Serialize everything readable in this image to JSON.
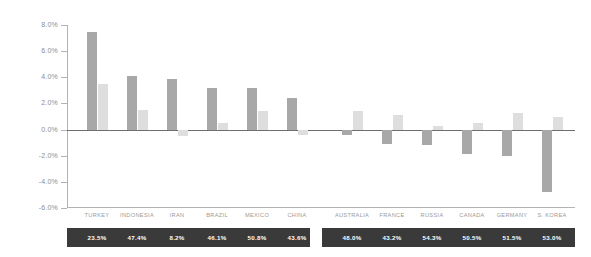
{
  "chart_data": {
    "type": "bar",
    "title": "",
    "subtitle": "",
    "xlabel": "",
    "ylabel": "",
    "ylim": [
      -6.0,
      8.0
    ],
    "yticks": [
      "8.0%",
      "6.0%",
      "4.0%",
      "2.0%",
      "0.0%",
      "-2.0%",
      "-4.0%",
      "-6.0%"
    ],
    "ytick_values": [
      8.0,
      6.0,
      4.0,
      2.0,
      0.0,
      -2.0,
      -4.0,
      -6.0
    ],
    "grid": false,
    "legend_position": "none",
    "categories": [
      "TURKEY",
      "INDONESIA",
      "IRAN",
      "BRAZIL",
      "MEXICO",
      "CHINA",
      "AUSTRALIA",
      "FRANCE",
      "RUSSIA",
      "CANADA",
      "GERMANY",
      "S. KOREA"
    ],
    "series": [
      {
        "name": "dark",
        "color": "#a8a8a8",
        "values": [
          7.5,
          4.1,
          3.9,
          3.2,
          3.2,
          2.4,
          -0.4,
          -1.1,
          -1.2,
          -1.9,
          -2.0,
          -4.8
        ]
      },
      {
        "name": "light",
        "color": "#dedede",
        "values": [
          3.5,
          1.5,
          -0.5,
          0.5,
          1.4,
          -0.4,
          1.4,
          1.1,
          0.3,
          0.5,
          1.3,
          1.0
        ]
      }
    ],
    "footer_values": [
      "23.5%",
      "47.4%",
      "8.2%",
      "46.1%",
      "50.8%",
      "43.6%",
      "48.0%",
      "43.2%",
      "54.3%",
      "50.5%",
      "51.5%",
      "53.0%"
    ],
    "footer_values_numeric": [
      23.5,
      47.4,
      8.2,
      46.1,
      50.8,
      43.6,
      48.0,
      43.2,
      54.3,
      50.5,
      51.5,
      53.0
    ]
  }
}
